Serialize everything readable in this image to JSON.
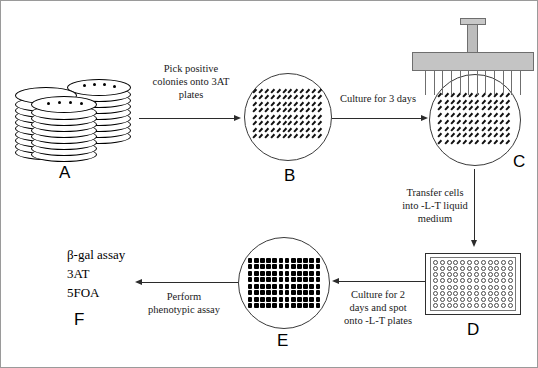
{
  "figure": {
    "type": "workflow-diagram",
    "background": "#ffffff",
    "border_color": "#9a9a9a",
    "line_color": "#000000",
    "device_fill": "#c4c4c4"
  },
  "panels": {
    "a": {
      "letter": "A",
      "name": "stacked-petri-dishes",
      "stacks": 3,
      "colony_dots_per_top_plate": 4
    },
    "b": {
      "letter": "B",
      "name": "streaked-3at-plate",
      "grid_rows": 8,
      "grid_cols": 12
    },
    "c": {
      "letter": "C",
      "name": "replica-plating-plate",
      "grid_rows": 8,
      "grid_cols": 12
    },
    "d": {
      "letter": "D",
      "name": "96-well-microplate",
      "well_rows": 8,
      "well_cols": 12,
      "well_total": 96
    },
    "e": {
      "letter": "E",
      "name": "spotted-lt-plate",
      "grid_rows": 8,
      "grid_cols": 12
    },
    "f": {
      "letter": "F",
      "name": "phenotypic-assay-results",
      "assays": [
        "β-gal assay",
        "3AT",
        "5FOA"
      ]
    }
  },
  "arrows": {
    "a_to_b": {
      "direction": "right",
      "lines": [
        "Pick positive",
        "colonies onto 3AT",
        "plates"
      ]
    },
    "b_to_c": {
      "direction": "right",
      "lines": [
        "Culture for 3 days"
      ]
    },
    "c_to_d": {
      "direction": "down",
      "lines": [
        "Transfer cells",
        "into -L-T liquid",
        "medium"
      ]
    },
    "d_to_e": {
      "direction": "left",
      "lines": [
        "Culture for 2",
        "days and spot",
        "onto -L-T plates"
      ]
    },
    "e_to_f": {
      "direction": "left",
      "lines": [
        "Perform",
        "phenotypic assay"
      ]
    }
  }
}
